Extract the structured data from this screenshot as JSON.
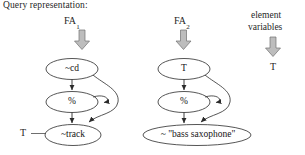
{
  "diagram": {
    "title": "Query representation:",
    "type": "query-representation-automata",
    "columns": [
      {
        "id": "fa1",
        "header": "FA",
        "header_subscript": "1",
        "arrow_icon": "block-down-arrow-icon",
        "nodes": [
          {
            "id": "cd",
            "label": "~cd"
          },
          {
            "id": "pct1",
            "label": "%"
          },
          {
            "id": "track",
            "label": "~track"
          }
        ],
        "side_label": "T"
      },
      {
        "id": "fa2",
        "header": "FA",
        "header_subscript": "2",
        "arrow_icon": "block-down-arrow-icon",
        "nodes": [
          {
            "id": "t",
            "label": "T"
          },
          {
            "id": "pct2",
            "label": "%"
          },
          {
            "id": "bass",
            "label": "~ \"bass saxophone\""
          }
        ],
        "side_label": ""
      }
    ],
    "element_variables": {
      "line1": "element",
      "line2": "variables",
      "arrow_icon": "block-down-arrow-icon",
      "value": "T"
    },
    "colors": {
      "stroke": "#2b2b2b",
      "arrow_fill": "#b8b8b8",
      "arrow_stroke": "#6e6e6e",
      "text": "#1a1a1a",
      "background": "#ffffff"
    }
  }
}
